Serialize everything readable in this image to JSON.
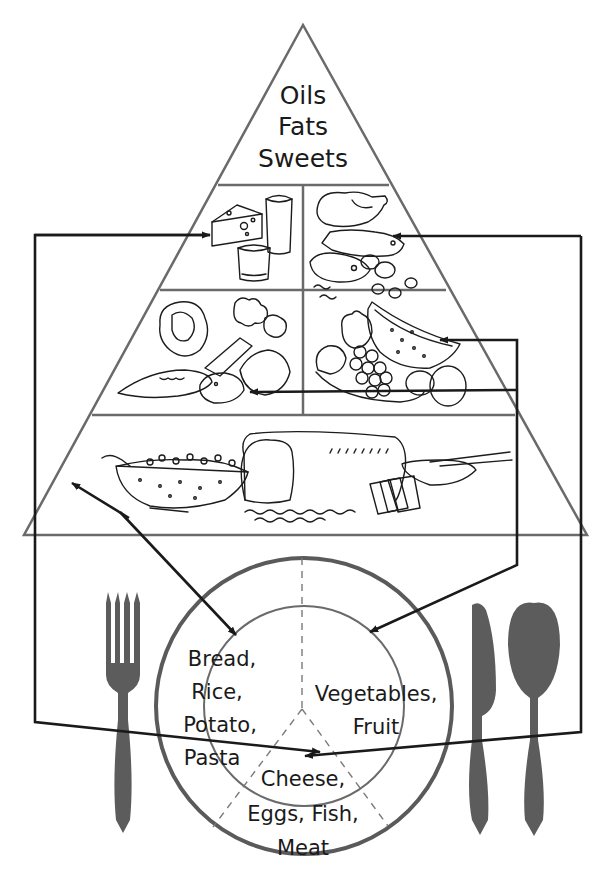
{
  "diagram": {
    "colors": {
      "outline": "#6a6a6a",
      "arrow": "#1a1a1a",
      "utensil": "#5c5c5c",
      "background": "#ffffff"
    },
    "pyramid": {
      "top": {
        "lines": [
          "Oils",
          "Fats",
          "Sweets"
        ]
      },
      "tiers": [
        {
          "id": "dairy",
          "illustration": "cheese-milk-yogurt"
        },
        {
          "id": "protein",
          "illustration": "chicken-fish-meat-eggs-nuts"
        },
        {
          "id": "vegetables",
          "illustration": "cabbage-broccoli-carrot-corn-potato"
        },
        {
          "id": "fruit",
          "illustration": "watermelon-apple-grapes-orange-banana"
        },
        {
          "id": "grains",
          "illustration": "pasta-bread-crackers-cereal"
        }
      ]
    },
    "plate": {
      "sections": [
        {
          "id": "grains",
          "lines": [
            "Bread,",
            "Rice,",
            "Potato,",
            "Pasta"
          ]
        },
        {
          "id": "produce",
          "lines": [
            "Vegetables,",
            "Fruit"
          ]
        },
        {
          "id": "protein",
          "lines": [
            "Cheese,",
            "Eggs, Fish,",
            "Meat"
          ]
        }
      ]
    },
    "arrows": [
      {
        "from": "plate-grains",
        "to": "pyramid-grains",
        "bidirectional": true
      },
      {
        "from": "pyramid-fruit",
        "to": "plate-produce"
      },
      {
        "from": "pyramid-fruit",
        "to": "pyramid-vegetables"
      },
      {
        "from": "pyramid-dairy",
        "to": "plate-protein"
      },
      {
        "from": "pyramid-protein",
        "to": "plate-protein"
      }
    ],
    "utensils": [
      "fork",
      "knife",
      "spoon"
    ]
  }
}
